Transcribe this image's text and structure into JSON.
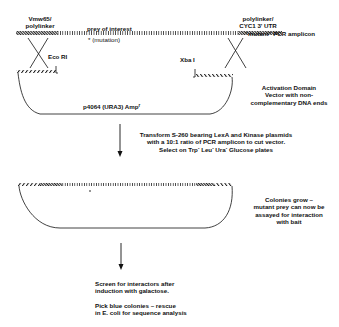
{
  "step1": {
    "left_flank_label_line1": "Vmw65/",
    "left_flank_label_line2": "polylinker",
    "prey_label": "prey of interest",
    "mutation_label": "* (mutation)",
    "right_flank_label_line1": "polylinker/",
    "right_flank_label_line2": "CYC1 3' UTR",
    "amplicon_label": "\"mutant\" PCR amplicon",
    "left_site": "Eco RI",
    "right_site": "Xba I",
    "vector_name": "p4064 (URA3) Amp",
    "vector_name_sup": "r",
    "vector_desc_line1": "Activation Domain",
    "vector_desc_line2": "Vector with non-",
    "vector_desc_line3": "complementary  DNA ends"
  },
  "step2": {
    "line1": "Transform S-260 bearing LexA and Kinase plasmids",
    "line2": "with a 10:1 ratio of PCR amplicon to cut vector.",
    "line3_a": "Select on Trp",
    "line3_b": " Leu",
    "line3_c": " Ura",
    "line3_d": " Glucose plates",
    "sup": "-"
  },
  "step3": {
    "line1": "Colonies grow –",
    "line2": "mutant prey can now be",
    "line3": "assayed for interaction",
    "line4": "with bait"
  },
  "step4": {
    "line1": "Screen for interactors after",
    "line2": "induction with galactose.",
    "line3": "Pick blue colonies – rescue",
    "line4": "in E. coli for sequence analysis"
  }
}
